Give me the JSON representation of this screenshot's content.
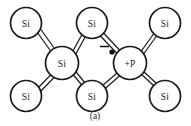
{
  "figure": {
    "caption": "(a)",
    "colors": {
      "background": "#ffffff",
      "atom_outline": "#1a1a1a",
      "atom_fill": "#ffffff",
      "bond": "#1f1f1f",
      "text": "#262626",
      "electron": "#111111"
    }
  },
  "atoms": [
    {
      "id": "si-top-left",
      "label": "Si",
      "cx": 26,
      "cy": 23,
      "r": 15.5,
      "kind": "silicon"
    },
    {
      "id": "si-top-center",
      "label": "Si",
      "cx": 92,
      "cy": 23,
      "r": 15.5,
      "kind": "silicon"
    },
    {
      "id": "si-top-right",
      "label": "Si",
      "cx": 165,
      "cy": 23,
      "r": 15.5,
      "kind": "silicon"
    },
    {
      "id": "si-middle-left",
      "label": "Si",
      "cx": 62,
      "cy": 63,
      "r": 16.5,
      "kind": "silicon"
    },
    {
      "id": "p-dopant-center",
      "label": "+P",
      "cx": 130,
      "cy": 63,
      "r": 16.5,
      "kind": "phosphorus-donor"
    },
    {
      "id": "si-bottom-left",
      "label": "Si",
      "cx": 26,
      "cy": 96,
      "r": 15.5,
      "kind": "silicon"
    },
    {
      "id": "si-bottom-center",
      "label": "Si",
      "cx": 92,
      "cy": 96,
      "r": 15.5,
      "kind": "silicon"
    },
    {
      "id": "si-bottom-right",
      "label": "Si",
      "cx": 165,
      "cy": 96,
      "r": 15.5,
      "kind": "silicon"
    }
  ],
  "bonds": [
    {
      "id": "bond-tl-ml",
      "from": "si-top-left",
      "to": "si-middle-left",
      "type": "covalent-pair"
    },
    {
      "id": "bond-bl-ml",
      "from": "si-bottom-left",
      "to": "si-middle-left",
      "type": "covalent-pair"
    },
    {
      "id": "bond-ml-tc",
      "from": "si-middle-left",
      "to": "si-top-center",
      "type": "covalent-pair"
    },
    {
      "id": "bond-ml-bc",
      "from": "si-middle-left",
      "to": "si-bottom-center",
      "type": "covalent-pair"
    },
    {
      "id": "bond-tc-p",
      "from": "si-top-center",
      "to": "p-dopant-center",
      "type": "covalent-pair"
    },
    {
      "id": "bond-bc-p",
      "from": "si-bottom-center",
      "to": "p-dopant-center",
      "type": "covalent-pair"
    },
    {
      "id": "bond-p-tr",
      "from": "p-dopant-center",
      "to": "si-top-right",
      "type": "covalent-pair"
    },
    {
      "id": "bond-p-br",
      "from": "p-dopant-center",
      "to": "si-bottom-right",
      "type": "covalent-pair"
    }
  ],
  "free_electron": {
    "id": "free-electron",
    "charge_sign": "minus",
    "dot": {
      "cx": 112,
      "cy": 52,
      "r": 2.6
    },
    "sign": {
      "x1": 100,
      "y1": 46.5,
      "x2": 109,
      "y2": 46.5
    }
  }
}
